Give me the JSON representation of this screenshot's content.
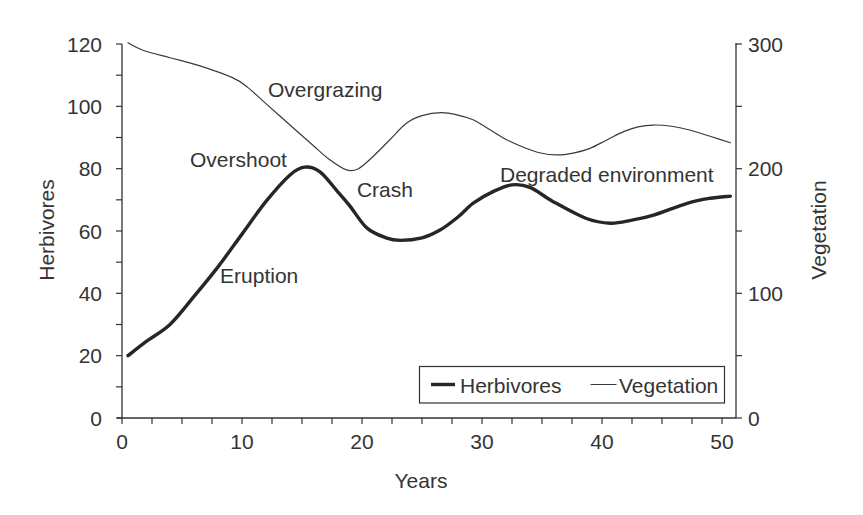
{
  "chart_data": {
    "type": "line",
    "title": "",
    "xlabel": "Years",
    "ylabel": "Herbivores",
    "y2label": "Vegetation",
    "xlim": [
      0,
      51.2
    ],
    "ylim": [
      0,
      120
    ],
    "y2lim": [
      0,
      300
    ],
    "xticks": [
      0,
      10,
      20,
      30,
      40,
      50
    ],
    "xticks_minor_step": 2.5,
    "yticks": [
      0,
      20,
      40,
      60,
      80,
      100,
      120
    ],
    "yticks_minor_step": 10,
    "y2ticks": [
      0,
      100,
      200,
      300
    ],
    "y2ticks_minor_step": 50,
    "grid": false,
    "legend": {
      "position": "lower right",
      "entries": [
        {
          "label": "Herbivores",
          "style": "thick"
        },
        {
          "label": "Vegetation",
          "style": "thin"
        }
      ]
    },
    "series": [
      {
        "name": "Herbivores",
        "axis": "left",
        "style": "thick",
        "x": [
          0.5,
          2,
          4,
          6,
          8,
          10,
          12,
          14,
          15.2,
          16.5,
          18,
          19,
          20.4,
          22,
          23.2,
          25,
          26.5,
          28,
          29.3,
          31,
          32.5,
          34,
          35.9,
          38.7,
          40.7,
          42.5,
          44.3,
          47.1,
          49,
          50.7
        ],
        "values": [
          20,
          24.5,
          30,
          39,
          48.5,
          59,
          69.5,
          78,
          80.5,
          79,
          72.5,
          68,
          61,
          57.8,
          57,
          57.8,
          60.3,
          64.5,
          69,
          72.8,
          74.8,
          74,
          69.5,
          64,
          62.5,
          63.5,
          65.1,
          68.9,
          70.5,
          71.2
        ]
      },
      {
        "name": "Vegetation",
        "axis": "right",
        "style": "thin",
        "x": [
          0.5,
          1.75,
          4,
          6.3,
          9.2,
          10.5,
          11.9,
          13.3,
          14.7,
          16,
          17.2,
          18.7,
          19.7,
          20.9,
          22.3,
          23.7,
          25,
          26.6,
          28,
          29.3,
          30.7,
          32.1,
          33.5,
          34.8,
          36.2,
          37.6,
          39,
          40.4,
          41.8,
          43,
          44.3,
          45.8,
          47.3,
          49,
          50.7
        ],
        "values": [
          301,
          295,
          289,
          283,
          273,
          265,
          253,
          241,
          229,
          218,
          208,
          199,
          200,
          209.6,
          223,
          236.4,
          242.5,
          245,
          243,
          239,
          231,
          223,
          217,
          212.8,
          211,
          212.5,
          216.3,
          223,
          229.7,
          233.5,
          235,
          234,
          231,
          226,
          220.8
        ]
      }
    ],
    "annotations": [
      {
        "text": "Overgrazing",
        "x": 12.17,
        "y": 103.0
      },
      {
        "text": "Overshoot",
        "x": 5.67,
        "y": 80.5
      },
      {
        "text": "Crash",
        "x": 19.58,
        "y": 70.9
      },
      {
        "text": "Degraded environment",
        "x": 31.5,
        "y": 75.7
      },
      {
        "text": "Eruption",
        "x": 8.17,
        "y": 43.3
      }
    ],
    "colors": {
      "herbivores": "#262626",
      "vegetation": "#3a3a3a",
      "axis": "#333333",
      "text": "#343434",
      "background": "#ffffff"
    }
  }
}
